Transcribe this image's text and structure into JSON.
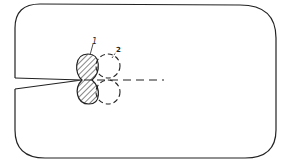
{
  "diagram": {
    "type": "crack-tip plastic zone schematic",
    "labels": {
      "zone1": "1",
      "zone2": "2"
    },
    "colors": {
      "stroke": "#222222",
      "background": "#ffffff"
    }
  }
}
